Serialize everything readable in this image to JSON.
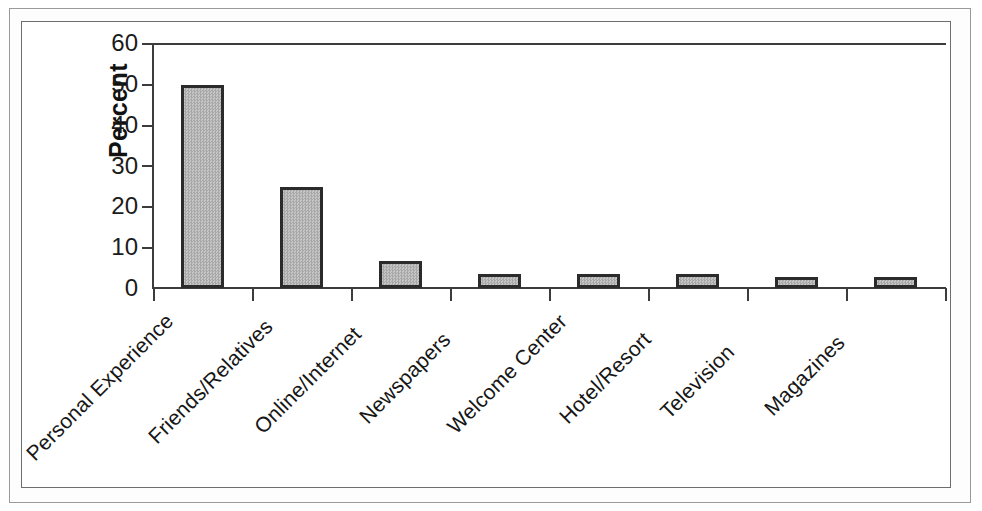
{
  "chart_data": {
    "type": "bar",
    "title": "",
    "subtitle": "",
    "xlabel": "",
    "ylabel": "Percent",
    "ylim": [
      0,
      60
    ],
    "yticks": [
      0,
      10,
      20,
      30,
      40,
      50,
      60
    ],
    "ytick_labels": [
      "0",
      "10",
      "20",
      "30",
      "40",
      "50",
      "60"
    ],
    "grid": false,
    "legend": null,
    "categories": [
      "Personal Experience",
      "Friends/Relatives",
      "Online/Internet",
      "Newspapers",
      "Welcome Center",
      "Hotel/Resort",
      "Television",
      "Magazines"
    ],
    "values": [
      50.0,
      24.8,
      6.6,
      3.5,
      3.4,
      3.4,
      2.7,
      2.7
    ],
    "bar_fill_color": "#b4b4b4",
    "bar_edge_color": "#2b2b2b",
    "axis_color": "#3c3c3c",
    "background_color": "#ffffff",
    "frame_color": "#6e6e6e",
    "outer_frame_color": "#9a9a9a"
  }
}
